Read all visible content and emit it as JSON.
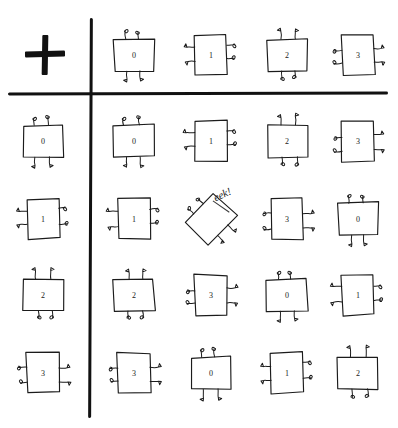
{
  "figure": {
    "kind": "hand-drawn-cayley-table",
    "operator_symbol": "+",
    "operator_icon": "plus-icon",
    "ink_color": "#111111",
    "paper_color": "#ffffff",
    "elements": [
      "0",
      "1",
      "2",
      "3"
    ],
    "note_text": "eek!"
  },
  "header_row": {
    "label": "column-headers",
    "cells": [
      {
        "value": "0",
        "rotation": 0
      },
      {
        "value": "1",
        "rotation": 90
      },
      {
        "value": "2",
        "rotation": 180
      },
      {
        "value": "3",
        "rotation": 270
      }
    ]
  },
  "row_headers": [
    {
      "value": "0",
      "rotation": 0
    },
    {
      "value": "1",
      "rotation": 90
    },
    {
      "value": "2",
      "rotation": 180
    },
    {
      "value": "3",
      "rotation": 270
    }
  ],
  "body_rows": [
    {
      "header": "0",
      "cells": [
        {
          "value": "0",
          "rotation": 0
        },
        {
          "value": "1",
          "rotation": 90
        },
        {
          "value": "2",
          "rotation": 180
        },
        {
          "value": "3",
          "rotation": 270
        }
      ]
    },
    {
      "header": "1",
      "cells": [
        {
          "value": "1",
          "rotation": 90
        },
        {
          "value": "eek!",
          "rotation": 45,
          "special": "tilted"
        },
        {
          "value": "3",
          "rotation": 270
        },
        {
          "value": "0",
          "rotation": 0
        }
      ]
    },
    {
      "header": "2",
      "cells": [
        {
          "value": "2",
          "rotation": 180
        },
        {
          "value": "3",
          "rotation": 270
        },
        {
          "value": "0",
          "rotation": 0
        },
        {
          "value": "1",
          "rotation": 90
        }
      ]
    },
    {
      "header": "3",
      "cells": [
        {
          "value": "3",
          "rotation": 270
        },
        {
          "value": "0",
          "rotation": 0
        },
        {
          "value": "1",
          "rotation": 90
        },
        {
          "value": "2",
          "rotation": 180
        }
      ]
    }
  ]
}
